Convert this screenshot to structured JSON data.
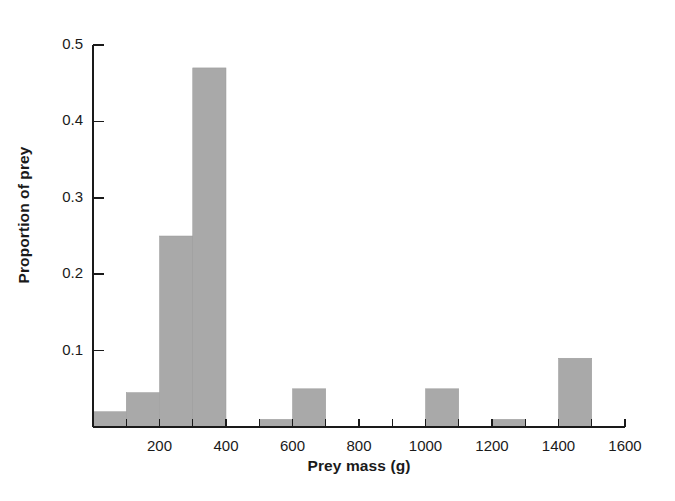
{
  "chart_data": {
    "type": "bar",
    "title": "",
    "subtitle": "",
    "xlabel": "Prey mass (g)",
    "ylabel": "Proportion of prey",
    "xlim": [
      0,
      1600
    ],
    "ylim": [
      0,
      0.5
    ],
    "grid": false,
    "legend": "none",
    "bin_width": 100,
    "bar_color": "#a9a9a9",
    "axis_color": "#1a1a1a",
    "background_color": "#ffffff",
    "x_major_ticks": [
      0,
      200,
      400,
      600,
      800,
      1000,
      1200,
      1400,
      1600
    ],
    "x_major_tick_labels": [
      "",
      "200",
      "400",
      "600",
      "800",
      "1000",
      "1200",
      "1400",
      "1600"
    ],
    "x_minor_ticks": [
      100,
      300,
      500,
      700,
      900,
      1100,
      1300,
      1500
    ],
    "y_ticks": [
      0.1,
      0.2,
      0.3,
      0.4,
      0.5
    ],
    "y_tick_labels": [
      "0.1",
      "0.2",
      "0.3",
      "0.4",
      "0.5"
    ],
    "bins": [
      {
        "x0": 0,
        "x1": 100,
        "value": 0.02
      },
      {
        "x0": 100,
        "x1": 200,
        "value": 0.045
      },
      {
        "x0": 200,
        "x1": 300,
        "value": 0.25
      },
      {
        "x0": 300,
        "x1": 400,
        "value": 0.47
      },
      {
        "x0": 400,
        "x1": 500,
        "value": 0.0
      },
      {
        "x0": 500,
        "x1": 600,
        "value": 0.01
      },
      {
        "x0": 600,
        "x1": 700,
        "value": 0.05
      },
      {
        "x0": 700,
        "x1": 800,
        "value": 0.0
      },
      {
        "x0": 800,
        "x1": 900,
        "value": 0.0
      },
      {
        "x0": 900,
        "x1": 1000,
        "value": 0.0
      },
      {
        "x0": 1000,
        "x1": 1100,
        "value": 0.05
      },
      {
        "x0": 1100,
        "x1": 1200,
        "value": 0.0
      },
      {
        "x0": 1200,
        "x1": 1300,
        "value": 0.01
      },
      {
        "x0": 1300,
        "x1": 1400,
        "value": 0.0
      },
      {
        "x0": 1400,
        "x1": 1500,
        "value": 0.09
      },
      {
        "x0": 1500,
        "x1": 1600,
        "value": 0.0
      }
    ],
    "categories": [
      "0-100",
      "100-200",
      "200-300",
      "300-400",
      "400-500",
      "500-600",
      "600-700",
      "700-800",
      "800-900",
      "900-1000",
      "1000-1100",
      "1100-1200",
      "1200-1300",
      "1300-1400",
      "1400-1500",
      "1500-1600"
    ],
    "values": [
      0.02,
      0.045,
      0.25,
      0.47,
      0.0,
      0.01,
      0.05,
      0.0,
      0.0,
      0.0,
      0.05,
      0.0,
      0.01,
      0.0,
      0.09,
      0.0
    ]
  }
}
